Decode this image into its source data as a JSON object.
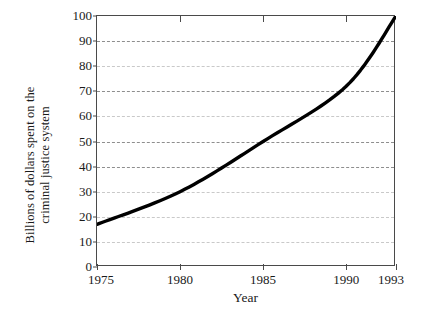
{
  "chart_data": {
    "type": "line",
    "title": "",
    "xlabel": "Year",
    "ylabel_line1": "Billions of dollars spent on the",
    "ylabel_line2": "criminal justice system",
    "ylabel": "Billions of dollars spent on the criminal justice system",
    "x": [
      1975,
      1980,
      1985,
      1990,
      1993
    ],
    "values": [
      17,
      30,
      50,
      72,
      100
    ],
    "series": [
      {
        "name": "Criminal justice spending",
        "values": [
          17,
          30,
          50,
          72,
          100
        ]
      }
    ],
    "xtick_labels": [
      "1975",
      "1980",
      "1985",
      "1990",
      "1993"
    ],
    "xtick_values": [
      1975,
      1980,
      1985,
      1990,
      1993
    ],
    "ytick_labels": [
      "0",
      "10",
      "20",
      "30",
      "40",
      "50",
      "60",
      "70",
      "80",
      "90",
      "100"
    ],
    "ytick_values": [
      0,
      10,
      20,
      30,
      40,
      50,
      60,
      70,
      80,
      90,
      100
    ],
    "xlim": [
      1975,
      1993
    ],
    "ylim": [
      0,
      100
    ],
    "grid": "horizontal-dashed",
    "legend": "none",
    "line_color": "#000000",
    "grid_color": "#8e8e8e",
    "axis_color": "#4a4a4a",
    "background_color": "#ffffff"
  }
}
